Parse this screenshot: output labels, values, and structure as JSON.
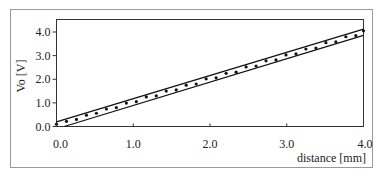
{
  "chart_data": {
    "type": "line",
    "title": "",
    "xlabel": "distance [mm]",
    "ylabel": "Vo [V]",
    "xlim": [
      0.0,
      4.0
    ],
    "ylim": [
      0.0,
      4.3
    ],
    "x_ticks": [
      0.0,
      1.0,
      2.0,
      3.0,
      4.0
    ],
    "x_tick_labels": [
      "0.0",
      "1.0",
      "2.0",
      "3.0",
      "4.0"
    ],
    "y_ticks": [
      0.0,
      1.0,
      2.0,
      3.0,
      4.0
    ],
    "y_tick_labels": [
      "0.0",
      "1.0",
      "2.0",
      "3.0",
      "4.0"
    ],
    "grid": false,
    "legend": "none",
    "series": [
      {
        "name": "upper-bound",
        "style": "line",
        "x": [
          0.0,
          4.0
        ],
        "y": [
          0.2,
          4.12
        ]
      },
      {
        "name": "lower-bound",
        "style": "line",
        "x": [
          0.1,
          4.0
        ],
        "y": [
          0.0,
          3.86
        ]
      },
      {
        "name": "measured",
        "style": "dots",
        "x": [
          0.0,
          0.13,
          0.26,
          0.39,
          0.52,
          0.65,
          0.78,
          0.91,
          1.04,
          1.17,
          1.3,
          1.43,
          1.56,
          1.69,
          1.82,
          1.95,
          2.08,
          2.21,
          2.34,
          2.47,
          2.6,
          2.73,
          2.86,
          2.99,
          3.12,
          3.25,
          3.38,
          3.51,
          3.64,
          3.77,
          3.9,
          4.0
        ],
        "y": [
          0.1,
          0.22,
          0.3,
          0.48,
          0.56,
          0.74,
          0.8,
          0.99,
          1.05,
          1.25,
          1.3,
          1.5,
          1.55,
          1.75,
          1.8,
          2.02,
          2.06,
          2.25,
          2.3,
          2.52,
          2.56,
          2.78,
          2.82,
          3.03,
          3.07,
          3.28,
          3.32,
          3.55,
          3.58,
          3.8,
          3.85,
          4.05
        ]
      }
    ]
  }
}
